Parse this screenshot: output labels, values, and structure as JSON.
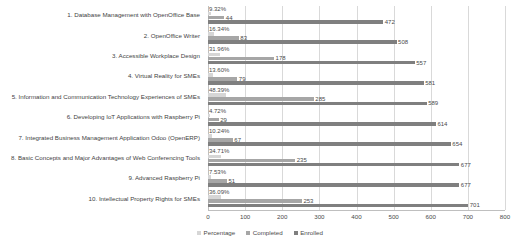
{
  "chart_data": {
    "type": "bar",
    "orientation": "horizontal",
    "title": "",
    "xlabel": "",
    "ylabel": "",
    "xlim": [
      0,
      800
    ],
    "xticks": [
      0,
      100,
      200,
      300,
      400,
      500,
      600,
      700,
      800
    ],
    "grid": true,
    "legend_position": "bottom",
    "categories": [
      "1. Database Management with OpenOffice Base",
      "2. OpenOffice Writer",
      "3. Accessible Workplace Design",
      "4. Virtual Reality for SMEs",
      "5. Information and Communication Technology Experiences of SMEs",
      "6. Developing IoT Applications with Raspberry Pi",
      "7. Integrated Business Management Application Odoo (OpenERP)",
      "8. Basic Concepts and Major Advantages of Web Conferencing Tools",
      "9. Advanced Raspberry Pi",
      "10. Intellectual Property Rights for SMEs"
    ],
    "series": [
      {
        "name": "Percentage",
        "color": "#d6d6d6",
        "values": [
          9.32,
          16.34,
          31.96,
          13.6,
          48.39,
          4.72,
          10.24,
          34.71,
          7.53,
          36.09
        ],
        "labels": [
          "9.32%",
          "16.34%",
          "31.96%",
          "13.60%",
          "48.39%",
          "4.72%",
          "10.24%",
          "34.71%",
          "7.53%",
          "36.09%"
        ]
      },
      {
        "name": "Completed",
        "color": "#a6a6a6",
        "values": [
          44,
          83,
          178,
          79,
          285,
          29,
          67,
          235,
          51,
          253
        ],
        "labels": [
          "44",
          "83",
          "178",
          "79",
          "285",
          "29",
          "67",
          "235",
          "51",
          "253"
        ]
      },
      {
        "name": "Enrolled",
        "color": "#7f7f7f",
        "values": [
          472,
          508,
          557,
          581,
          589,
          614,
          654,
          677,
          677,
          701
        ],
        "labels": [
          "472",
          "508",
          "557",
          "581",
          "589",
          "614",
          "654",
          "677",
          "677",
          "701"
        ]
      }
    ]
  },
  "legend": {
    "items": [
      {
        "label": "Percentage"
      },
      {
        "label": "Completed"
      },
      {
        "label": "Enrolled"
      }
    ]
  }
}
